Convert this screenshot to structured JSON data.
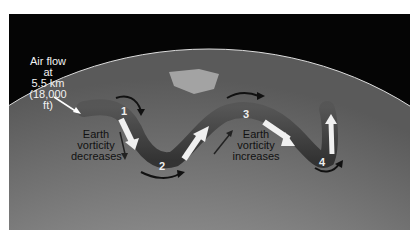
{
  "diagram": {
    "air_flow_label": [
      "Air flow",
      "at",
      "5.5 km",
      "(18,000 ft)"
    ],
    "left_label": [
      "Earth",
      "vorticity",
      "decreases"
    ],
    "right_label": [
      "Earth",
      "vorticity",
      "increases"
    ],
    "points": [
      "1",
      "2",
      "3",
      "4"
    ],
    "colors": {
      "background": "#050505",
      "earth": "#8a8a8a",
      "flow_band": "#3a3a3a",
      "arrow_light": "#f0f0f0",
      "arrow_dark": "#1a1a1a"
    }
  }
}
